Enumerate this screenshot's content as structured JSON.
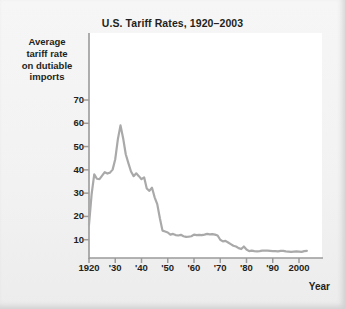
{
  "chart_data": {
    "type": "line",
    "title": "U.S. Tariff Rates, 1920–2003",
    "xlabel": "Year",
    "ylabel": "Average tariff rate on dutiable imports",
    "ylabel_lines": [
      "Average",
      "tariff rate",
      "on dutiable",
      "imports"
    ],
    "xlim": [
      1920,
      2003
    ],
    "ylim": [
      0,
      75
    ],
    "grid": false,
    "legend": null,
    "y_ticks": [
      10,
      20,
      30,
      40,
      50,
      60,
      70
    ],
    "y_tick_labels": [
      "10",
      "20",
      "30",
      "40",
      "50",
      "60",
      "70"
    ],
    "x_ticks": [
      1920,
      1930,
      1940,
      1950,
      1960,
      1970,
      1980,
      1990,
      2000
    ],
    "x_tick_labels": [
      "1920",
      "'30",
      "'40",
      "'50",
      "'60",
      "'70",
      "'80",
      "'90",
      "2000"
    ],
    "line_color": "#a9a9a9",
    "line_width": 2.2,
    "series": [
      {
        "name": "Average tariff rate on dutiable imports",
        "x": [
          1920,
          1921,
          1922,
          1923,
          1924,
          1925,
          1926,
          1927,
          1928,
          1929,
          1930,
          1931,
          1932,
          1933,
          1934,
          1935,
          1936,
          1937,
          1938,
          1939,
          1940,
          1941,
          1942,
          1943,
          1944,
          1945,
          1946,
          1947,
          1948,
          1949,
          1950,
          1951,
          1952,
          1953,
          1954,
          1955,
          1956,
          1957,
          1958,
          1959,
          1960,
          1961,
          1962,
          1963,
          1964,
          1965,
          1966,
          1967,
          1968,
          1969,
          1970,
          1971,
          1972,
          1973,
          1974,
          1975,
          1976,
          1977,
          1978,
          1979,
          1980,
          1981,
          1982,
          1983,
          1984,
          1985,
          1986,
          1987,
          1988,
          1989,
          1990,
          1991,
          1992,
          1993,
          1994,
          1995,
          1996,
          1997,
          1998,
          1999,
          2000,
          2001,
          2002,
          2003
        ],
        "values": [
          16.4,
          29.6,
          38.1,
          36.2,
          36.0,
          37.5,
          39.0,
          38.4,
          38.8,
          40.1,
          44.6,
          53.2,
          59.1,
          53.6,
          46.7,
          42.9,
          39.3,
          37.3,
          38.5,
          37.3,
          36.0,
          36.8,
          32.0,
          31.0,
          32.3,
          28.2,
          25.3,
          19.2,
          13.9,
          13.5,
          13.1,
          12.2,
          12.5,
          12.0,
          11.8,
          12.1,
          11.5,
          11.2,
          11.3,
          11.5,
          12.2,
          12.0,
          12.1,
          12.0,
          12.2,
          12.5,
          12.3,
          12.4,
          12.2,
          11.8,
          10.0,
          9.3,
          9.5,
          8.8,
          8.1,
          7.4,
          7.1,
          6.4,
          6.0,
          7.1,
          5.8,
          5.1,
          5.3,
          5.1,
          5.0,
          5.1,
          5.3,
          5.3,
          5.3,
          5.2,
          5.1,
          5.1,
          5.0,
          5.2,
          5.2,
          5.0,
          4.9,
          4.8,
          4.9,
          5.0,
          4.9,
          4.8,
          5.1,
          5.2
        ]
      }
    ]
  }
}
